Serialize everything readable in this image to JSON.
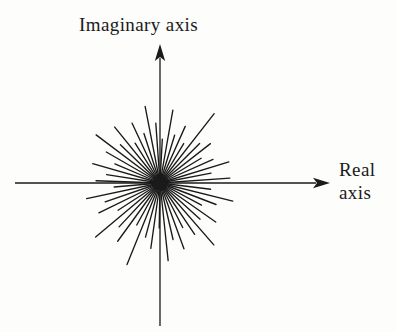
{
  "figure": {
    "name": "complex-plane-phasor-starburst",
    "background_color": "#fdfdfb",
    "ink_color": "#1a1a1a"
  },
  "labels": {
    "imaginary_axis": "Imaginary axis",
    "real_axis_line1": "Real",
    "real_axis_line2": "axis"
  },
  "chart_data": {
    "type": "scatter",
    "title": "",
    "subtitle": "",
    "xlabel": "Real axis",
    "ylabel": "Imaginary axis",
    "grid": false,
    "legend": null,
    "annotations": [],
    "origin_px": [
      160,
      183
    ],
    "axes": {
      "horizontal": {
        "x1": 15,
        "y1": 183,
        "x2": 330,
        "y2": 183,
        "arrow_at": "end"
      },
      "vertical": {
        "x1": 160,
        "y1": 326,
        "x2": 160,
        "y2": 44,
        "arrow_at": "end"
      },
      "xlim": [
        -1.1,
        1.1
      ],
      "ylim": [
        -1.1,
        1.1
      ],
      "xticks": [],
      "yticks": []
    },
    "series": [
      {
        "name": "phasors",
        "units": "degrees, pixels",
        "points": [
          {
            "angle": 4,
            "length": 70
          },
          {
            "angle": 11,
            "length": 52
          },
          {
            "angle": 17,
            "length": 72
          },
          {
            "angle": 24,
            "length": 58
          },
          {
            "angle": 31,
            "length": 48
          },
          {
            "angle": 38,
            "length": 64
          },
          {
            "angle": 45,
            "length": 56
          },
          {
            "angle": 52,
            "length": 88
          },
          {
            "angle": 59,
            "length": 46
          },
          {
            "angle": 66,
            "length": 62
          },
          {
            "angle": 73,
            "length": 50
          },
          {
            "angle": 80,
            "length": 74
          },
          {
            "angle": 87,
            "length": 44
          },
          {
            "angle": 94,
            "length": 60
          },
          {
            "angle": 101,
            "length": 78
          },
          {
            "angle": 108,
            "length": 52
          },
          {
            "angle": 115,
            "length": 66
          },
          {
            "angle": 122,
            "length": 47
          },
          {
            "angle": 129,
            "length": 72
          },
          {
            "angle": 136,
            "length": 55
          },
          {
            "angle": 143,
            "length": 80
          },
          {
            "angle": 150,
            "length": 62
          },
          {
            "angle": 157,
            "length": 49
          },
          {
            "angle": 164,
            "length": 70
          },
          {
            "angle": 171,
            "length": 54
          },
          {
            "angle": 178,
            "length": 64
          },
          {
            "angle": 185,
            "length": 46
          },
          {
            "angle": 192,
            "length": 75
          },
          {
            "angle": 199,
            "length": 58
          },
          {
            "angle": 206,
            "length": 68
          },
          {
            "angle": 213,
            "length": 50
          },
          {
            "angle": 220,
            "length": 84
          },
          {
            "angle": 227,
            "length": 60
          },
          {
            "angle": 234,
            "length": 72
          },
          {
            "angle": 241,
            "length": 48
          },
          {
            "angle": 248,
            "length": 88
          },
          {
            "angle": 255,
            "length": 56
          },
          {
            "angle": 262,
            "length": 66
          },
          {
            "angle": 269,
            "length": 45
          },
          {
            "angle": 276,
            "length": 78
          },
          {
            "angle": 283,
            "length": 58
          },
          {
            "angle": 290,
            "length": 70
          },
          {
            "angle": 297,
            "length": 50
          },
          {
            "angle": 304,
            "length": 62
          },
          {
            "angle": 311,
            "length": 82
          },
          {
            "angle": 318,
            "length": 54
          },
          {
            "angle": 325,
            "length": 68
          },
          {
            "angle": 332,
            "length": 47
          },
          {
            "angle": 339,
            "length": 60
          },
          {
            "angle": 346,
            "length": 75
          },
          {
            "angle": 353,
            "length": 51
          }
        ]
      }
    ]
  }
}
